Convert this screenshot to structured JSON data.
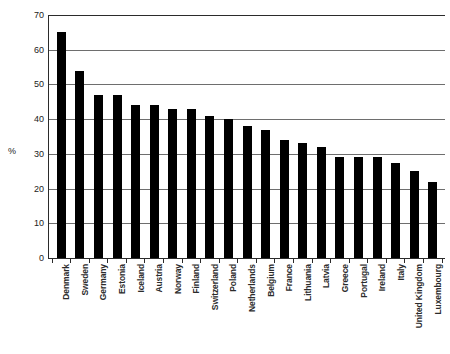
{
  "chart_data": {
    "type": "bar",
    "title": "",
    "xlabel": "",
    "ylabel": "%",
    "ylim": [
      0,
      70
    ],
    "yticks": [
      0,
      10,
      20,
      30,
      40,
      50,
      60,
      70
    ],
    "grid": true,
    "legend": "none",
    "bar_color": "#000000",
    "categories": [
      "Denmark",
      "Sweden",
      "Germany",
      "Estonia",
      "Iceland",
      "Austria",
      "Norway",
      "Finland",
      "Switzerland",
      "Poland",
      "Netherlands",
      "Belgium",
      "France",
      "Lithuania",
      "Latvia",
      "Greece",
      "Portugal",
      "Ireland",
      "Italy",
      "United Kingdom",
      "Luxembourg"
    ],
    "values": [
      65,
      54,
      47,
      47,
      44,
      44,
      43,
      43,
      41,
      40,
      38,
      37,
      34,
      33,
      32,
      29,
      29,
      29,
      27.5,
      25,
      22
    ]
  }
}
